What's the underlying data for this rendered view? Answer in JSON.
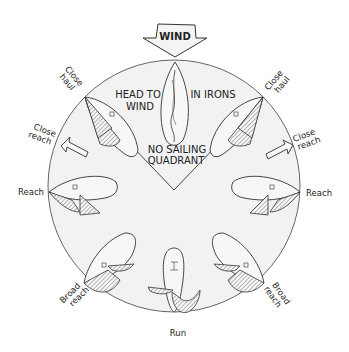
{
  "diagram": {
    "colors": {
      "background": "#ffffff",
      "circle_fill": "#f2f2f2",
      "stroke": "#333333"
    },
    "wind_arrow": {
      "label": "WIND",
      "icon": "down-arrow-icon"
    },
    "center_labels": {
      "head_to_wind_line1": "HEAD TO",
      "head_to_wind_line2": "WIND",
      "in_irons": "IN IRONS",
      "no_sailing_line1": "NO SAILING",
      "no_sailing_line2": "QUADRANT"
    },
    "points_of_sail": {
      "left": [
        {
          "line1": "Close",
          "line2": "haul"
        },
        {
          "line1": "Close",
          "line2": "reach"
        },
        {
          "line1": "Reach",
          "line2": ""
        },
        {
          "line1": "Broad",
          "line2": "reach"
        }
      ],
      "right": [
        {
          "line1": "Close",
          "line2": "haul"
        },
        {
          "line1": "Close",
          "line2": "reach"
        },
        {
          "line1": "Reach",
          "line2": ""
        },
        {
          "line1": "Broad",
          "line2": "reach"
        }
      ],
      "bottom": {
        "line1": "Run"
      }
    }
  }
}
